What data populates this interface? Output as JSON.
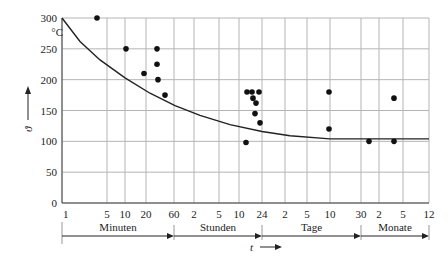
{
  "chart_data": {
    "type": "scatter",
    "title": "",
    "xlabel": "t",
    "ylabel": "ϑ",
    "y_unit": "°C",
    "ylim": [
      0,
      300
    ],
    "y_ticks": [
      0,
      50,
      100,
      150,
      200,
      250,
      300
    ],
    "x_scale": "logarithmic time (1 min … 12 months)",
    "x_ticks": [
      {
        "label": "1",
        "px": 62
      },
      {
        "label": "5",
        "px": 107
      },
      {
        "label": "10",
        "px": 125
      },
      {
        "label": "20",
        "px": 146
      },
      {
        "label": "60",
        "px": 174
      },
      {
        "label": "2",
        "px": 194
      },
      {
        "label": "5",
        "px": 219
      },
      {
        "label": "10",
        "px": 239
      },
      {
        "label": "24",
        "px": 262
      },
      {
        "label": "2",
        "px": 285
      },
      {
        "label": "5",
        "px": 307
      },
      {
        "label": "10",
        "px": 330
      },
      {
        "label": "30",
        "px": 361
      },
      {
        "label": "2",
        "px": 379
      },
      {
        "label": "5",
        "px": 403
      },
      {
        "label": "12",
        "px": 429
      }
    ],
    "time_segments": [
      {
        "label": "Minuten",
        "from_px": 62,
        "to_px": 174
      },
      {
        "label": "Stunden",
        "from_px": 174,
        "to_px": 262
      },
      {
        "label": "Tage",
        "from_px": 262,
        "to_px": 361
      },
      {
        "label": "Monate",
        "from_px": 361,
        "to_px": 429
      }
    ],
    "grid": true,
    "series": [
      {
        "name": "Messpunkte",
        "type": "scatter",
        "points": [
          {
            "t": "3 min",
            "px": 97,
            "y": 300
          },
          {
            "t": "10 min",
            "px": 126,
            "y": 250
          },
          {
            "t": "18 min",
            "px": 144,
            "y": 210
          },
          {
            "t": "30 min",
            "px": 157,
            "y": 250
          },
          {
            "t": "30 min",
            "px": 157,
            "y": 225
          },
          {
            "t": "30 min",
            "px": 158,
            "y": 200
          },
          {
            "t": "40 min",
            "px": 165,
            "y": 175
          },
          {
            "t": "12 h",
            "px": 247,
            "y": 180
          },
          {
            "t": "14 h",
            "px": 252,
            "y": 180
          },
          {
            "t": "18 h",
            "px": 259,
            "y": 180
          },
          {
            "t": "15 h",
            "px": 253,
            "y": 170
          },
          {
            "t": "16 h",
            "px": 256,
            "y": 162
          },
          {
            "t": "16 h",
            "px": 255,
            "y": 145
          },
          {
            "t": "18 h",
            "px": 260,
            "y": 130
          },
          {
            "t": "12 h",
            "px": 246,
            "y": 98
          },
          {
            "t": "10 d",
            "px": 329,
            "y": 180
          },
          {
            "t": "10 d",
            "px": 329,
            "y": 120
          },
          {
            "t": "40 d",
            "px": 369,
            "y": 100
          },
          {
            "t": "4 mo",
            "px": 394,
            "y": 170
          },
          {
            "t": "4 mo",
            "px": 394,
            "y": 100
          }
        ]
      },
      {
        "name": "Grenzkurve",
        "type": "line",
        "points": [
          {
            "px": 62,
            "y": 300
          },
          {
            "px": 80,
            "y": 262
          },
          {
            "px": 100,
            "y": 232
          },
          {
            "px": 125,
            "y": 203
          },
          {
            "px": 150,
            "y": 178
          },
          {
            "px": 175,
            "y": 158
          },
          {
            "px": 200,
            "y": 142
          },
          {
            "px": 230,
            "y": 127
          },
          {
            "px": 262,
            "y": 116
          },
          {
            "px": 290,
            "y": 109
          },
          {
            "px": 330,
            "y": 104
          },
          {
            "px": 429,
            "y": 104
          }
        ]
      }
    ]
  }
}
